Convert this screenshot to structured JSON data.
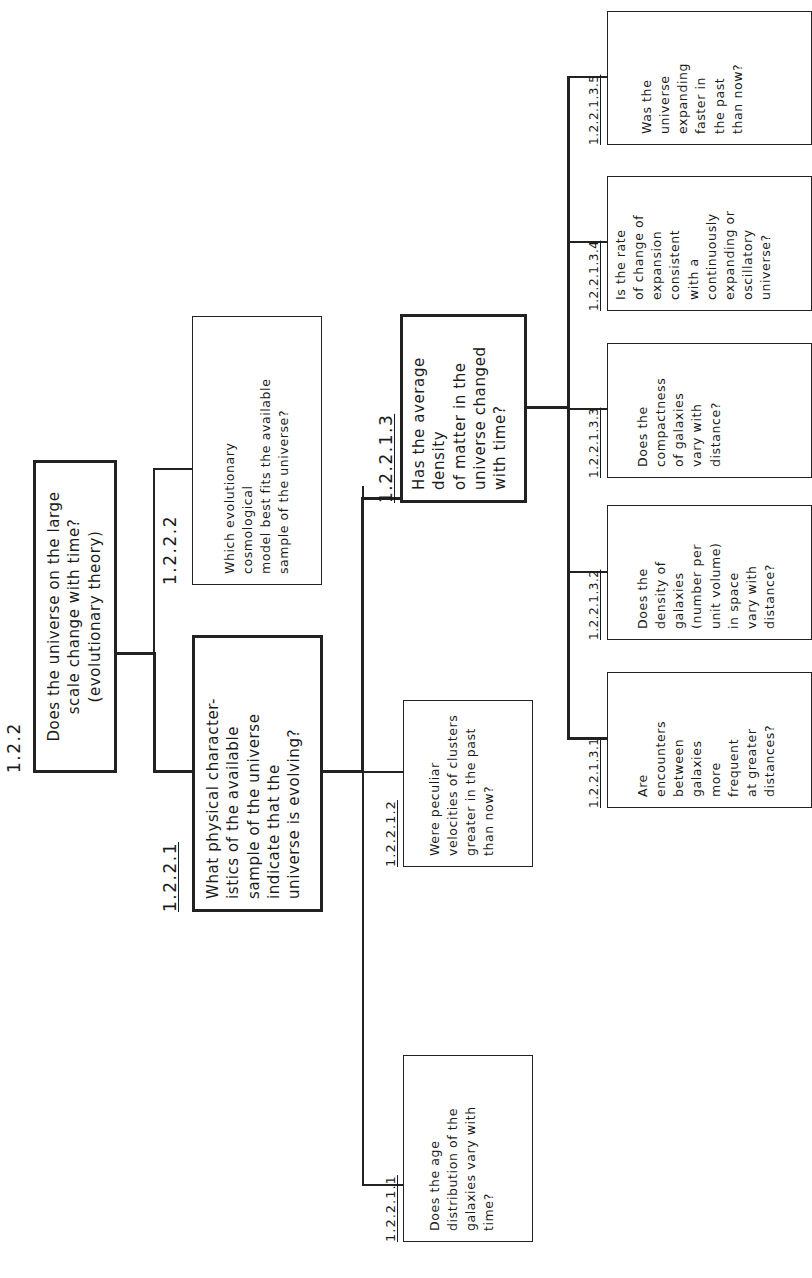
{
  "diagram": {
    "orientation": "rotated 90 degrees counter-clockwise",
    "nodes": {
      "n122": {
        "id": "1.2.2",
        "lines": [
          "Does the universe on the large",
          "scale change with time?",
          "(evolutionary theory)"
        ]
      },
      "n1221": {
        "id": "1.2.2.1",
        "lines": [
          "What physical character-",
          "istics of the available",
          "sample of the universe",
          "indicate that the",
          "universe is evolving?"
        ]
      },
      "n1222": {
        "id": "1.2.2.2",
        "lines": [
          "Which evolutionary",
          "cosmological",
          "model best fits the available",
          "sample of the universe?"
        ]
      },
      "n12211": {
        "id": "1.2.2.1.1",
        "lines": [
          "Does the age",
          "distribution of the",
          "galaxies vary with",
          "time?"
        ]
      },
      "n12212": {
        "id": "1.2.2.1.2",
        "lines": [
          "Were peculiar",
          "velocities of clusters",
          "greater in the past",
          "than now?"
        ]
      },
      "n12213": {
        "id": "1.2.2.1.3",
        "lines": [
          "Has the average",
          "density",
          "of matter in the",
          "universe changed",
          "with time?"
        ]
      },
      "n122131": {
        "id": "1.2.2.1.3.1",
        "lines": [
          "Are",
          "encounters",
          "between",
          "galaxies",
          "more",
          "frequent",
          "at greater",
          "distances?"
        ]
      },
      "n122132": {
        "id": "1.2.2.1.3.2",
        "lines": [
          "Does the",
          "density of",
          "galaxies",
          "(number per",
          "unit volume)",
          "in space",
          "vary with",
          "distance?"
        ]
      },
      "n122133": {
        "id": "1.2.2.1.3.3",
        "lines": [
          "Does the",
          "compactness",
          "of galaxies",
          "vary with",
          "distance?"
        ]
      },
      "n122134": {
        "id": "1.2.2.1.3.4",
        "lines": [
          "Is the rate",
          "of change of",
          "expansion",
          "consistent",
          "with a",
          "continuously",
          "expanding or",
          "oscillatory",
          "universe?"
        ]
      },
      "n122135": {
        "id": "1.2.2.1.3.5",
        "lines": [
          "Was the",
          "universe",
          "expanding",
          "faster in",
          "the past",
          "than now?"
        ]
      }
    }
  }
}
